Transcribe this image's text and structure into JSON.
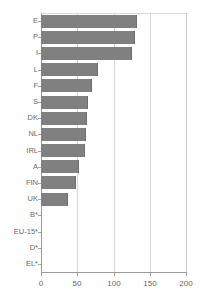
{
  "chart_data": {
    "type": "bar",
    "orientation": "horizontal",
    "title": "",
    "xlabel": "",
    "ylabel": "",
    "xlim": [
      0,
      200
    ],
    "xticks": [
      0,
      50,
      100,
      150,
      200
    ],
    "xtick_labels": [
      "0",
      "50",
      "100",
      "150",
      "200"
    ],
    "grid": true,
    "legend": false,
    "categories": [
      "E",
      "P",
      "I",
      "L",
      "F",
      "S",
      "DK",
      "NL",
      "IRL",
      "A",
      "FIN",
      "UK",
      "B*",
      "EU-15*",
      "D*",
      "EL*"
    ],
    "values": [
      132,
      130,
      125,
      79,
      70,
      65,
      63,
      62,
      60,
      52,
      48,
      37,
      0,
      0,
      0,
      0
    ],
    "bar_color": "#808080",
    "gridline_color": "#d9d9d9",
    "axis_color": "#9a9a9a"
  }
}
